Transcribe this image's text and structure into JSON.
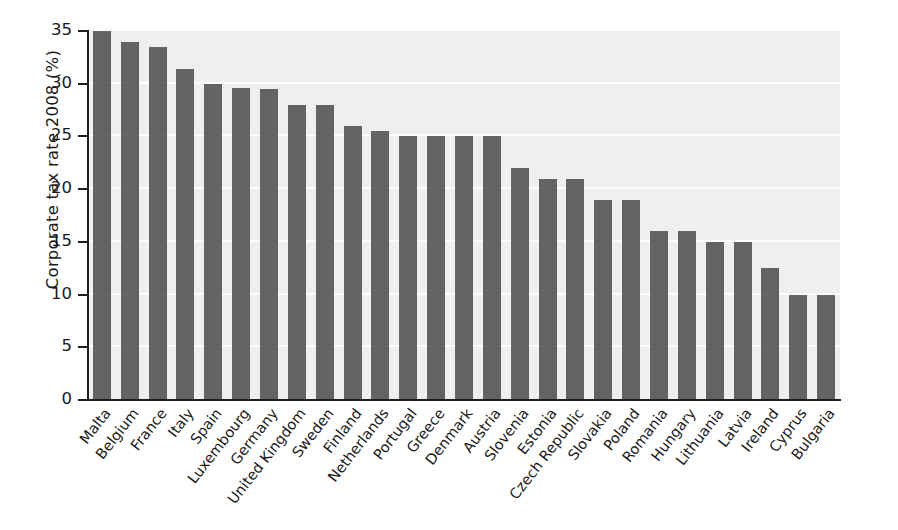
{
  "chart_data": {
    "type": "bar",
    "title": "",
    "xlabel": "",
    "ylabel": "Corporate tax rate 2008 (%)",
    "ylim": [
      0,
      35
    ],
    "yticks": [
      0,
      5,
      10,
      15,
      20,
      25,
      30,
      35
    ],
    "ytick_labels": [
      "0",
      "5",
      "10",
      "15",
      "20",
      "25",
      "30",
      "35"
    ],
    "grid": true,
    "grid_axis": "y",
    "grid_color": "#fdfdfd",
    "legend": false,
    "bar_color": "#5c5c5c",
    "plot_background": "#efefef",
    "xtick_rotation": -52,
    "categories": [
      "Malta",
      "Belgium",
      "France",
      "Italy",
      "Spain",
      "Luxembourg",
      "Germany",
      "United Kingdom",
      "Sweden",
      "Finland",
      "Netherlands",
      "Portugal",
      "Greece",
      "Denmark",
      "Austria",
      "Slovenia",
      "Estonia",
      "Czech Republic",
      "Slovakia",
      "Poland",
      "Romania",
      "Hungary",
      "Lithuania",
      "Latvia",
      "Ireland",
      "Cyprus",
      "Bulgaria"
    ],
    "values": [
      35.0,
      34.0,
      33.5,
      31.4,
      30.0,
      29.6,
      29.5,
      28.0,
      28.0,
      26.0,
      25.5,
      25.0,
      25.0,
      25.0,
      25.0,
      22.0,
      21.0,
      21.0,
      19.0,
      19.0,
      16.0,
      16.0,
      15.0,
      15.0,
      12.5,
      10.0,
      10.0
    ]
  }
}
